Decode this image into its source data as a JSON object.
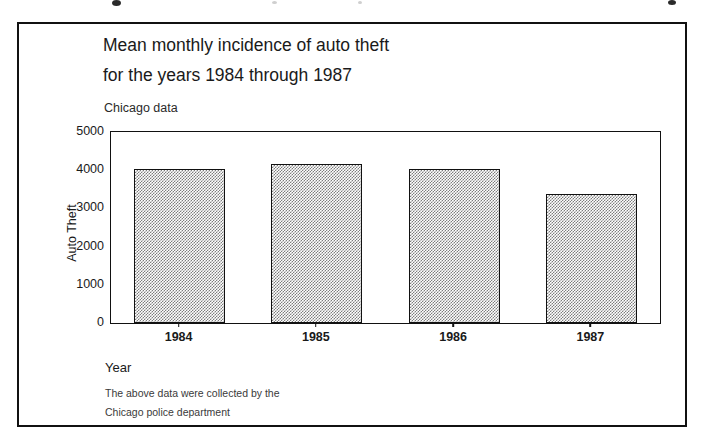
{
  "page": {
    "background_color": "#ffffff",
    "frame_border_color": "#111111"
  },
  "figure": {
    "title": "Mean monthly incidence of auto theft\nfor the years 1984 through 1987",
    "subtitle": "Chicago data",
    "x_axis_label": "Year",
    "y_axis_label": "Auto Theft",
    "footnote": "The above data were collected by the\nChicago police department"
  },
  "chart_data": {
    "type": "bar",
    "title": "Mean monthly incidence of auto theft for the years 1984 through 1987",
    "subtitle": "Chicago data",
    "xlabel": "Year",
    "ylabel": "Auto Theft",
    "categories": [
      "1984",
      "1985",
      "1986",
      "1987"
    ],
    "values": [
      4030,
      4160,
      4030,
      3375
    ],
    "ylim": [
      0,
      5000
    ],
    "yticks": [
      0,
      1000,
      2000,
      3000,
      4000,
      5000
    ],
    "ytick_labels": [
      "0",
      "1000",
      "2000",
      "3000",
      "4000",
      "5000"
    ],
    "grid": false,
    "legend": false,
    "bar_fill": "#7d7d7d",
    "bar_fill_style": "checkerboard-dither",
    "bar_edge_color": "#111111",
    "annotation": "The above data were collected by the Chicago police department"
  }
}
